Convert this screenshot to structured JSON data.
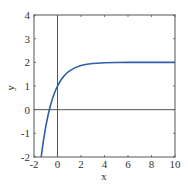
{
  "chart_data": {
    "type": "line",
    "title": "",
    "xlabel": "x",
    "ylabel": "y",
    "xlim": [
      -2,
      10
    ],
    "ylim": [
      -2,
      4
    ],
    "xticks": [
      -2,
      0,
      2,
      4,
      6,
      8,
      10
    ],
    "yticks": [
      -2,
      -1,
      0,
      1,
      2,
      3,
      4
    ],
    "xtick_labels": [
      "-2",
      "0",
      "2",
      "4",
      "6",
      "8",
      "10"
    ],
    "ytick_labels": [
      "-2",
      "-1",
      "0",
      "1",
      "2",
      "3",
      "4"
    ],
    "grid": false,
    "reference_lines": {
      "x0": true,
      "y0": true
    },
    "series": [
      {
        "name": "y = 2 - e^(-x)",
        "color": "#2e5fa8",
        "x": [
          -1.386,
          -1.2,
          -1.0,
          -0.8,
          -0.6,
          -0.4,
          -0.2,
          0,
          0.25,
          0.5,
          0.75,
          1,
          1.5,
          2,
          2.5,
          3,
          4,
          5,
          6,
          7,
          8,
          9,
          10
        ],
        "y": [
          -2.0,
          -1.32,
          -0.718,
          -0.226,
          0.178,
          0.508,
          0.779,
          1.0,
          1.221,
          1.393,
          1.528,
          1.632,
          1.777,
          1.865,
          1.918,
          1.95,
          1.982,
          1.993,
          1.998,
          1.999,
          2.0,
          2.0,
          2.0
        ]
      }
    ]
  },
  "colors": {
    "axis": "#555555",
    "curve": "#2e5fa8",
    "background": "#ffffff"
  }
}
